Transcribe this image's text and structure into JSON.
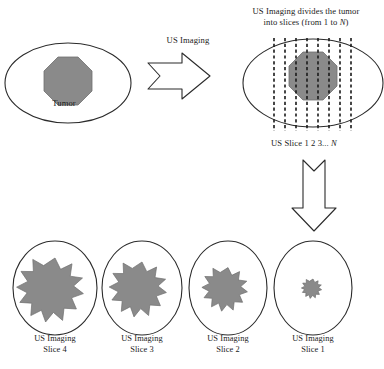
{
  "figure": {
    "title_note": "US Imaging tumor slicing diagram",
    "colors": {
      "tumor_fill": "#8a8a8a",
      "outline": "#2b2b2b",
      "background": "#ffffff"
    },
    "labels": {
      "header_line1": "US Imaging divides the tumor",
      "header_line2_pre": "into slices (from 1 to ",
      "header_line2_italic": "N",
      "header_line2_post": ")",
      "us_imaging": "US Imaging",
      "us_slice_pre": "US Slice 1 2 3... ",
      "us_slice_italic": "N",
      "tumor": "Tumor"
    },
    "slices": [
      {
        "id": "slice-4",
        "line1": "US Imaging",
        "line2": "Slice 4",
        "star_scale": 1.0
      },
      {
        "id": "slice-3",
        "line1": "US Imaging",
        "line2": "Slice 3",
        "star_scale": 0.86
      },
      {
        "id": "slice-2",
        "line1": "US Imaging",
        "line2": "Slice 2",
        "star_scale": 0.68
      },
      {
        "id": "slice-1",
        "line1": "US Imaging",
        "line2": "Slice 1",
        "star_scale": 0.3
      }
    ],
    "slice_lines_count": 8,
    "arrows": [
      {
        "name": "arrow-right-us-imaging",
        "direction": "right"
      },
      {
        "name": "arrow-down-to-slices",
        "direction": "down"
      }
    ]
  }
}
